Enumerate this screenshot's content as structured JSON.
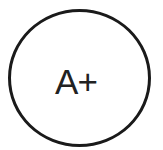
{
  "badge": {
    "label": "A+",
    "shape": "circle-outline",
    "stroke_color": "#1a1a1a",
    "text_color": "#222222"
  }
}
